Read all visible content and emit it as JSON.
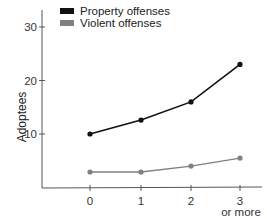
{
  "chart_data": {
    "type": "line",
    "title": "",
    "xlabel": "",
    "ylabel": "Adoptees",
    "categories": [
      "0",
      "1",
      "2",
      "3\nor more"
    ],
    "category_lines": [
      [
        "0"
      ],
      [
        "1"
      ],
      [
        "2"
      ],
      [
        "3",
        "or more"
      ]
    ],
    "series": [
      {
        "name": "Property offenses",
        "color": "#111111",
        "values": [
          10.0,
          12.6,
          16.0,
          23.0
        ]
      },
      {
        "name": "Violent offenses",
        "color": "#808080",
        "values": [
          2.9,
          2.9,
          4.0,
          5.5
        ]
      }
    ],
    "yticks": [
      10,
      20,
      30
    ],
    "ylim": [
      0,
      33
    ],
    "grid": false,
    "legend_position": "top-left"
  }
}
